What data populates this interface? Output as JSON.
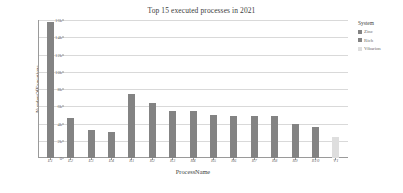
{
  "chart_data": {
    "type": "bar",
    "title": "Top 15 executed processes in 2021",
    "xlabel": "ProcessName",
    "ylabel": "NumberOfExecutions",
    "categories": [
      "E1",
      "E2",
      "E3",
      "E4",
      "R1",
      "R2",
      "R3",
      "R4",
      "R5",
      "R6",
      "R7",
      "R8",
      "R9",
      "R10",
      "V1"
    ],
    "values": [
      15800,
      4600,
      3300,
      3050,
      7400,
      6400,
      5500,
      5400,
      5000,
      4850,
      4850,
      4850,
      3900,
      3550,
      2450
    ],
    "bar_colors": [
      "#838383",
      "#838383",
      "#838383",
      "#838383",
      "#838383",
      "#838383",
      "#838383",
      "#838383",
      "#838383",
      "#838383",
      "#838383",
      "#838383",
      "#838383",
      "#838383",
      "#dedede"
    ],
    "ylim": [
      0,
      16000
    ],
    "yticks": [
      0,
      2000,
      4000,
      6000,
      8000,
      10000,
      12000,
      14000,
      16000
    ],
    "ytick_labels": [
      "0",
      "2k",
      "4k",
      "6k",
      "8k",
      "10k",
      "12k",
      "14k",
      "16k"
    ],
    "grid": true,
    "legend_position": "right",
    "legend": {
      "title": "System",
      "entries": [
        {
          "label": "Zinc",
          "color": "#838383"
        },
        {
          "label": "Rich",
          "color": "#838383"
        },
        {
          "label": "Vibarion",
          "color": "#dedede"
        }
      ]
    }
  }
}
